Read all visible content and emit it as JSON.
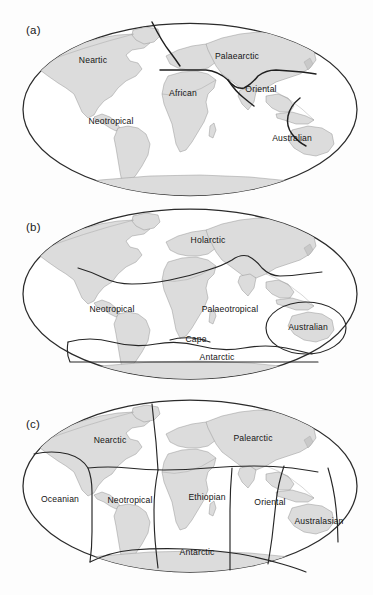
{
  "figure": {
    "background_color": "#fdfdfd",
    "land_fill_color": "#dcdcdc",
    "outline_color": "#2b2b2b",
    "boundary_color": "#1f1f1f",
    "projection": "Mollweide"
  },
  "panels": [
    {
      "id": "a",
      "label": "(a)",
      "scheme": "zoogeographic regions",
      "regions": [
        {
          "name": "Neartic",
          "x": 93,
          "y": 63
        },
        {
          "name": "Palaearctic",
          "x": 237,
          "y": 59
        },
        {
          "name": "African",
          "x": 183,
          "y": 96
        },
        {
          "name": "Oriental",
          "x": 261,
          "y": 92
        },
        {
          "name": "Neotropical",
          "x": 111,
          "y": 124
        },
        {
          "name": "Australian",
          "x": 292,
          "y": 141
        }
      ]
    },
    {
      "id": "b",
      "label": "(b)",
      "scheme": "floral kingdoms",
      "regions": [
        {
          "name": "Holarctic",
          "x": 208,
          "y": 243
        },
        {
          "name": "Neotropical",
          "x": 112,
          "y": 312
        },
        {
          "name": "Palaeotropical",
          "x": 230,
          "y": 312
        },
        {
          "name": "Australian",
          "x": 308,
          "y": 330
        },
        {
          "name": "Cape",
          "x": 196,
          "y": 342
        },
        {
          "name": "Antarctic",
          "x": 217,
          "y": 360
        }
      ]
    },
    {
      "id": "c",
      "label": "(c)",
      "scheme": "terrestrial biogeographic realms",
      "regions": [
        {
          "name": "Nearctic",
          "x": 110,
          "y": 443
        },
        {
          "name": "Palearctic",
          "x": 253,
          "y": 441
        },
        {
          "name": "Oceanian",
          "x": 60,
          "y": 502
        },
        {
          "name": "Neotropical",
          "x": 130,
          "y": 503
        },
        {
          "name": "Ethiopian",
          "x": 207,
          "y": 500
        },
        {
          "name": "Oriental",
          "x": 270,
          "y": 505
        },
        {
          "name": "Australasian",
          "x": 319,
          "y": 524
        },
        {
          "name": "Antarctic",
          "x": 197,
          "y": 555
        }
      ]
    }
  ]
}
